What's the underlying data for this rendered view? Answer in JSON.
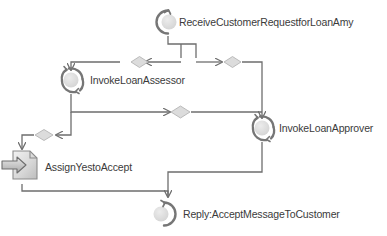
{
  "diagram": {
    "type": "bpel-process-flow",
    "background_color": "#ffffff",
    "line_color": "#6e6e6e",
    "node_fill": "#d9d9d9",
    "node_stroke": "#8c8c8c",
    "text_color": "#3b3b3b",
    "title": "",
    "nodes": [
      {
        "id": "receive",
        "label": "ReceiveCustomerRequestforLoanAmy",
        "icon": "receive-activity-icon",
        "x": 155,
        "y": 10
      },
      {
        "id": "invoke_assessor",
        "label": "InvokeLoanAssessor",
        "icon": "invoke-activity-icon",
        "x": 58,
        "y": 64
      },
      {
        "id": "invoke_approver",
        "label": "InvokeLoanApprover",
        "icon": "invoke-activity-icon",
        "x": 247,
        "y": 112
      },
      {
        "id": "assign",
        "label": "AssignYestoAccept",
        "icon": "assign-activity-icon",
        "x": 12,
        "y": 152
      },
      {
        "id": "reply",
        "label": "Reply:AcceptMessageToCustomer",
        "icon": "reply-activity-icon",
        "x": 152,
        "y": 201
      }
    ],
    "gateways": [
      {
        "id": "gw-assessor-in",
        "name": "diamond-gateway",
        "x": 131,
        "y": 57
      },
      {
        "id": "gw-approver-in",
        "name": "diamond-gateway",
        "x": 231,
        "y": 57
      },
      {
        "id": "gw-assessor-out",
        "name": "diamond-gateway",
        "x": 179,
        "y": 112
      },
      {
        "id": "gw-assign-in",
        "name": "diamond-gateway",
        "x": 44,
        "y": 130
      }
    ],
    "edge_count": 8
  }
}
